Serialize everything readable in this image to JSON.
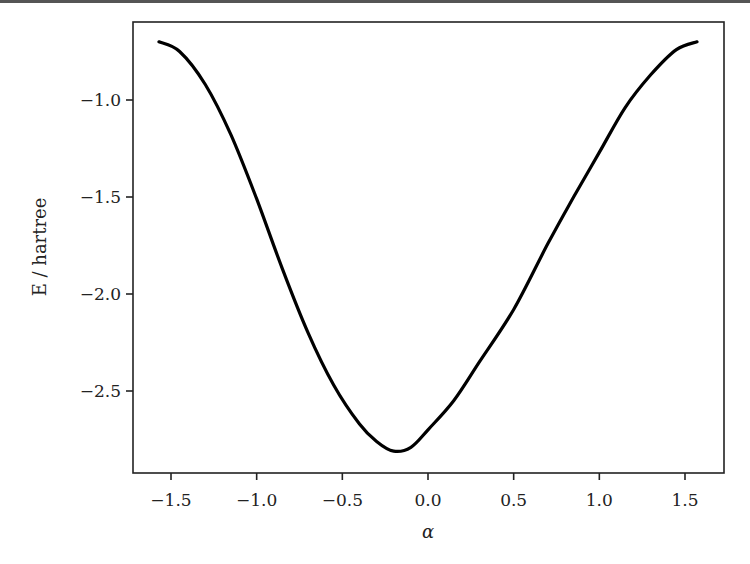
{
  "chart_data": {
    "type": "line",
    "title": "",
    "xlabel": "α",
    "ylabel": "E / hartree",
    "xlim": [
      -1.75,
      1.75
    ],
    "ylim": [
      -2.88,
      -0.62
    ],
    "grid": false,
    "legend": null,
    "xticks": [
      -1.5,
      -1.0,
      -0.5,
      0.0,
      0.5,
      1.0,
      1.5
    ],
    "xtick_labels": [
      "−1.5",
      "−1.0",
      "−0.5",
      "0.0",
      "0.5",
      "1.0",
      "1.5"
    ],
    "yticks": [
      -1.0,
      -1.5,
      -2.0,
      -2.5
    ],
    "ytick_labels": [
      "−1.0",
      "−1.5",
      "−2.0",
      "−2.5"
    ],
    "series": [
      {
        "name": "E(α)",
        "color": "#000000",
        "x": [
          -1.57,
          -1.45,
          -1.3,
          -1.15,
          -1.0,
          -0.85,
          -0.7,
          -0.55,
          -0.4,
          -0.3,
          -0.2,
          -0.1,
          0.0,
          0.15,
          0.3,
          0.5,
          0.7,
          0.85,
          1.0,
          1.15,
          1.3,
          1.45,
          1.57
        ],
        "y": [
          -0.7,
          -0.75,
          -0.92,
          -1.18,
          -1.51,
          -1.87,
          -2.2,
          -2.47,
          -2.67,
          -2.76,
          -2.81,
          -2.79,
          -2.7,
          -2.55,
          -2.35,
          -2.08,
          -1.74,
          -1.5,
          -1.27,
          -1.04,
          -0.87,
          -0.74,
          -0.7
        ]
      }
    ]
  }
}
